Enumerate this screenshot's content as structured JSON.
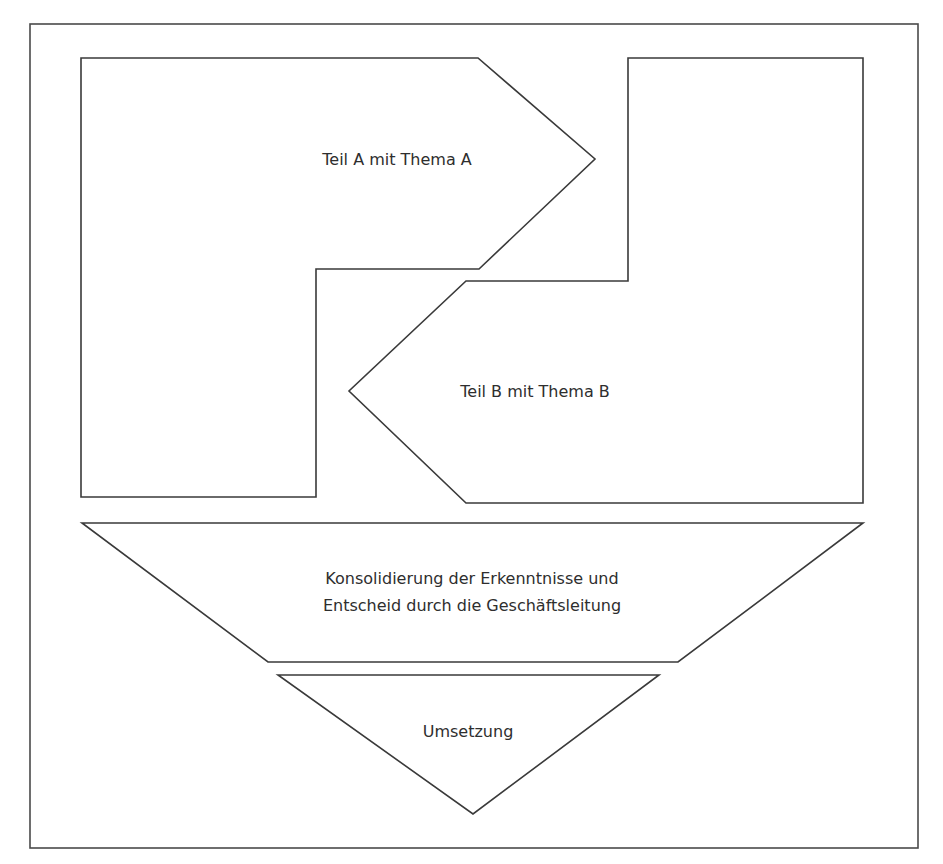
{
  "diagram": {
    "title": "",
    "colors": {
      "stroke": "#3a3a3a",
      "frame": "#4a4a4a",
      "fill": "#ffffff",
      "text": "#2e2e2e"
    },
    "shapes": {
      "teil_a": {
        "label": "Teil A mit Thema A",
        "kind": "notched-arrow-right"
      },
      "teil_b": {
        "label": "Teil B mit Thema B",
        "kind": "notched-arrow-left"
      },
      "konsolidierung": {
        "line1": "Konsolidierung der Erkenntnisse und",
        "line2": "Entscheid durch die Geschäftsleitung",
        "kind": "inverted-trapezoid"
      },
      "umsetzung": {
        "label": "Umsetzung",
        "kind": "inverted-triangle"
      }
    },
    "flow": [
      "Teil A mit Thema A",
      "Teil B mit Thema B",
      "Konsolidierung",
      "Umsetzung"
    ]
  }
}
